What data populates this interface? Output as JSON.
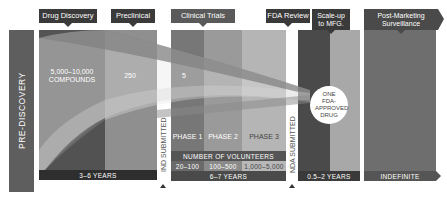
{
  "colors": {
    "dark": "#3a3a3a",
    "pre_discovery": "#5e5e5e",
    "discovery": "#6a6a6a",
    "preclinical": "#8f8f8f",
    "phase1": "#777777",
    "phase2": "#9a9a9a",
    "phase3": "#b5b5b5",
    "fda_review": "#4a4a4a",
    "scaleup": "#a8a8a8",
    "post_marketing": "#6e6e6e",
    "funnel": "#d8d8d8"
  },
  "header_labels": [
    {
      "id": "drug-discovery",
      "label": "Drug Discovery"
    },
    {
      "id": "preclinical",
      "label": "Preclinical"
    },
    {
      "id": "clinical-trials",
      "label": "Clinical Trials"
    },
    {
      "id": "fda-review",
      "label": "FDA Review"
    },
    {
      "id": "scale-up",
      "label": "Scale-up to MFG."
    },
    {
      "id": "post-marketing",
      "label": "Post-Marketing Surveillance"
    }
  ],
  "pre_discovery": {
    "label": "PRE-DISCOVERY"
  },
  "counts": {
    "compounds": "5,000–10,000 COMPOUNDS",
    "preclinical": "250",
    "clinical": "5"
  },
  "phases": [
    "PHASE 1",
    "PHASE 2",
    "PHASE 3"
  ],
  "volunteers": {
    "title": "NUMBER OF VOLUNTEERS",
    "ranges": [
      "20–100",
      "100–500",
      "1,000–5,000"
    ]
  },
  "milestones": {
    "ind": "IND SUBMITTED",
    "nda": "NDA SUBMITTED"
  },
  "result": {
    "label": "ONE FDA-APPROVED DRUG"
  },
  "durations": {
    "discovery": "3–6 YEARS",
    "clinical": "6–7 YEARS",
    "scaleup": "0.5–2 YEARS",
    "post_marketing": "INDEFINITE"
  }
}
